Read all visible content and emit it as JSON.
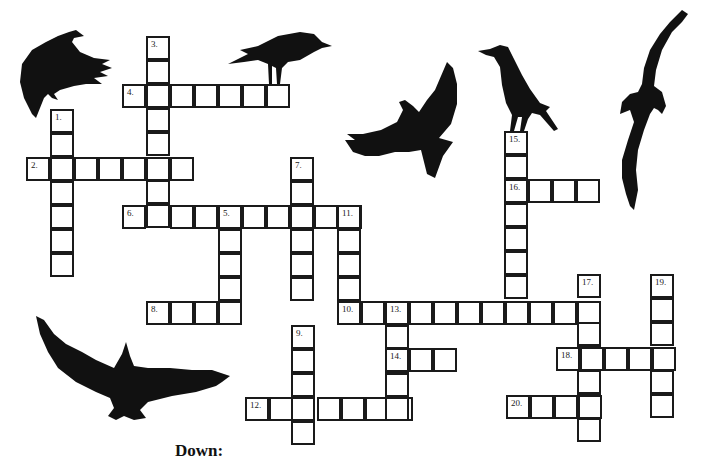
{
  "puzzle": {
    "type": "crossword",
    "theme": "crows",
    "cell_size": 24,
    "line_color": "#1a1a1a",
    "background": "#ffffff",
    "words": [
      {
        "number": "1.",
        "direction": "down",
        "x": 50,
        "y": 109,
        "length": 7
      },
      {
        "number": "2.",
        "direction": "across",
        "x": 26,
        "y": 157,
        "length": 7
      },
      {
        "number": "3.",
        "direction": "down",
        "x": 146,
        "y": 36,
        "length": 8
      },
      {
        "number": "4.",
        "direction": "across",
        "x": 122,
        "y": 84,
        "length": 7
      },
      {
        "number": "5.",
        "direction": "down",
        "x": 218,
        "y": 205,
        "length": 5
      },
      {
        "number": "6.",
        "direction": "across",
        "x": 122,
        "y": 205,
        "length": 10
      },
      {
        "number": "7.",
        "direction": "down",
        "x": 290,
        "y": 157,
        "length": 6
      },
      {
        "number": "8.",
        "direction": "across",
        "x": 146,
        "y": 301,
        "length": 4
      },
      {
        "number": "9.",
        "direction": "down",
        "x": 291,
        "y": 325,
        "length": 5
      },
      {
        "number": "10.",
        "direction": "across",
        "x": 337,
        "y": 301,
        "length": 11
      },
      {
        "number": "11.",
        "direction": "down",
        "x": 337,
        "y": 205,
        "length": 4
      },
      {
        "number": "12.",
        "direction": "across",
        "x": 245,
        "y": 397,
        "length": 7
      },
      {
        "number": "13.",
        "direction": "down",
        "x": 385,
        "y": 301,
        "length": 5
      },
      {
        "number": "14.",
        "direction": "across",
        "x": 385,
        "y": 348,
        "length": 3
      },
      {
        "number": "15.",
        "direction": "down",
        "x": 504,
        "y": 131,
        "length": 8
      },
      {
        "number": "16.",
        "direction": "across",
        "x": 504,
        "y": 179,
        "length": 4
      },
      {
        "number": "17.",
        "direction": "down",
        "x": 577,
        "y": 274,
        "length": 7
      },
      {
        "number": "18.",
        "direction": "across",
        "x": 556,
        "y": 347,
        "length": 5
      },
      {
        "number": "19.",
        "direction": "down",
        "x": 650,
        "y": 274,
        "length": 6
      },
      {
        "number": "20.",
        "direction": "across",
        "x": 506,
        "y": 395,
        "length": 4
      }
    ]
  },
  "illustrations": [
    {
      "name": "crow-landing-top-left",
      "x": 14,
      "y": 28,
      "w": 100,
      "h": 92
    },
    {
      "name": "crow-perched-on-4",
      "x": 228,
      "y": 28,
      "w": 106,
      "h": 56
    },
    {
      "name": "crow-flying-center",
      "x": 343,
      "y": 60,
      "w": 122,
      "h": 118
    },
    {
      "name": "crow-perched-on-15",
      "x": 478,
      "y": 45,
      "w": 82,
      "h": 90
    },
    {
      "name": "crow-diving-right",
      "x": 612,
      "y": 10,
      "w": 78,
      "h": 202
    },
    {
      "name": "crow-soaring-bottom-left",
      "x": 36,
      "y": 312,
      "w": 196,
      "h": 110
    }
  ],
  "clues": {
    "down_heading": "Down:"
  }
}
